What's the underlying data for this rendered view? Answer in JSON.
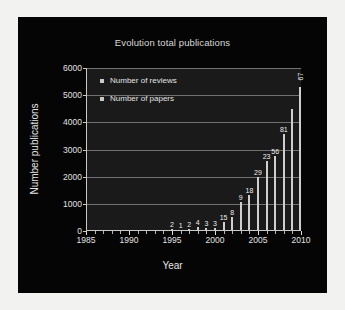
{
  "figure": {
    "title": "Evolution total publications",
    "xlabel": "Year",
    "ylabel": "Number publications",
    "legend": [
      {
        "label": "Number of reviews",
        "marker": "square-marker"
      },
      {
        "label": "Number of papers",
        "marker": "square-marker"
      }
    ],
    "colors": {
      "panel_background": "#050505",
      "plot_background": "#1a1a1a",
      "gridline": "#8e8e8e",
      "bar": "#cfcfcf",
      "text": "#e3e3e3"
    }
  },
  "chart_data": {
    "type": "bar",
    "title": "Evolution total publications",
    "xlabel": "Year",
    "ylabel": "Number publications",
    "xlim": [
      1985,
      2010
    ],
    "ylim": [
      0,
      6000
    ],
    "xticks": [
      1985,
      1990,
      1995,
      2000,
      2005,
      2010
    ],
    "yticks": [
      0,
      1000,
      2000,
      3000,
      4000,
      5000,
      6000
    ],
    "grid": true,
    "legend_position": "upper left",
    "categories": [
      1995,
      1996,
      1997,
      1998,
      1999,
      2000,
      2001,
      2002,
      2003,
      2004,
      2005,
      2006,
      2007,
      2008,
      2009
    ],
    "series": [
      {
        "name": "Number of papers",
        "values": [
          60,
          40,
          70,
          130,
          110,
          120,
          330,
          500,
          1050,
          1320,
          1990,
          2560,
          2760,
          3560,
          4500
        ]
      },
      {
        "name": "Number of reviews",
        "values": [
          2,
          1,
          2,
          4,
          3,
          3,
          15,
          8,
          9,
          18,
          29,
          23,
          56,
          81,
          67
        ]
      }
    ],
    "annotations": [
      {
        "x": 1995,
        "text": "2",
        "rotation": 0
      },
      {
        "x": 1996,
        "text": "1",
        "rotation": 0
      },
      {
        "x": 1997,
        "text": "2",
        "rotation": 0
      },
      {
        "x": 1998,
        "text": "4",
        "rotation": 0
      },
      {
        "x": 1999,
        "text": "3",
        "rotation": 0
      },
      {
        "x": 2000,
        "text": "3",
        "rotation": 0
      },
      {
        "x": 2001,
        "text": "15",
        "rotation": 0
      },
      {
        "x": 2002,
        "text": "8",
        "rotation": 0
      },
      {
        "x": 2003,
        "text": "9",
        "rotation": 0
      },
      {
        "x": 2004,
        "text": "18",
        "rotation": 0
      },
      {
        "x": 2005,
        "text": "29",
        "rotation": 0
      },
      {
        "x": 2006,
        "text": "23",
        "rotation": 0
      },
      {
        "x": 2007,
        "text": "56",
        "rotation": 0
      },
      {
        "x": 2008,
        "text": "81",
        "rotation": 0
      },
      {
        "x": 2009,
        "text": "67",
        "rotation": -90
      }
    ],
    "extra_bars": {
      "note": "tall bar at far right reaches about 5300",
      "values": [
        5300
      ]
    }
  }
}
